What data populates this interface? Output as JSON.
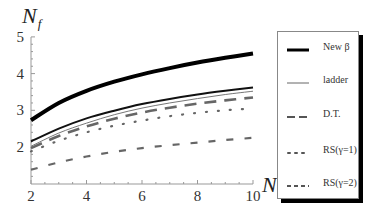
{
  "chart_data": {
    "type": "line",
    "title": "",
    "xlabel": "N_c",
    "ylabel": "N_f",
    "xlim": [
      2,
      10
    ],
    "ylim": [
      1.0,
      5
    ],
    "x_ticks": [
      "2",
      "4",
      "6",
      "8",
      "10"
    ],
    "y_ticks": [
      "2",
      "3",
      "4",
      "5"
    ],
    "grid": false,
    "legend_position": "right-outside",
    "x": [
      2,
      3,
      4,
      5,
      6,
      7,
      8,
      9,
      10
    ],
    "series": [
      {
        "name": "New β",
        "style": "solid-thick",
        "values": [
          2.73,
          3.2,
          3.53,
          3.78,
          3.98,
          4.15,
          4.3,
          4.43,
          4.55
        ]
      },
      {
        "name": "",
        "style": "solid",
        "values": [
          2.15,
          2.5,
          2.78,
          2.99,
          3.17,
          3.31,
          3.43,
          3.53,
          3.62
        ]
      },
      {
        "name": "ladder",
        "style": "solid-thin",
        "values": [
          2.02,
          2.38,
          2.65,
          2.88,
          3.06,
          3.2,
          3.32,
          3.43,
          3.52
        ]
      },
      {
        "name": "D.T.",
        "style": "long-dash",
        "values": [
          1.97,
          2.3,
          2.56,
          2.77,
          2.94,
          3.07,
          3.18,
          3.27,
          3.35
        ]
      },
      {
        "name": "RS(γ=1)",
        "style": "dotted",
        "values": [
          1.88,
          2.17,
          2.4,
          2.58,
          2.72,
          2.84,
          2.93,
          3.0,
          3.05
        ]
      },
      {
        "name": "RS(γ=2)",
        "style": "short-dash",
        "values": [
          1.38,
          1.58,
          1.74,
          1.87,
          1.97,
          2.05,
          2.12,
          2.19,
          2.25
        ]
      }
    ]
  },
  "axes": {
    "y_title_main": "N",
    "y_title_sub": "f",
    "x_title_main": "N",
    "x_title_sub": "c"
  },
  "legend": {
    "items": [
      {
        "label": "New β"
      },
      {
        "label": "ladder"
      },
      {
        "label": "D.T."
      },
      {
        "label": "RS(γ=1)"
      },
      {
        "label": "RS(γ=2)"
      }
    ]
  }
}
